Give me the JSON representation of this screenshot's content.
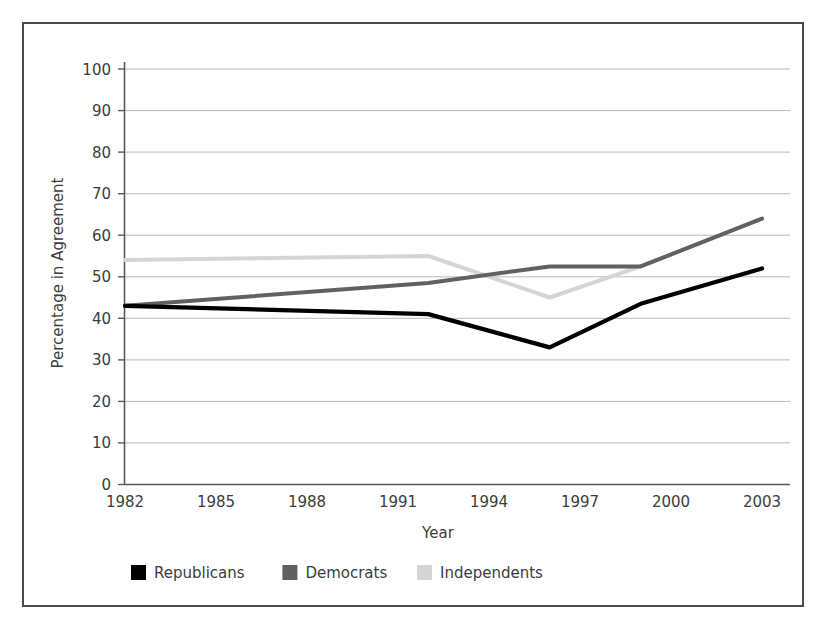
{
  "figure": {
    "background_color": "#ffffff",
    "frame_color": "#4a4a4a"
  },
  "chart_data": {
    "type": "line",
    "title": "",
    "xlabel": "Year",
    "ylabel": "Percentage in Agreement",
    "x": [
      1982,
      1992,
      1996,
      1999,
      2003
    ],
    "xticks": [
      1982,
      1985,
      1988,
      1991,
      1994,
      1997,
      2000,
      2003
    ],
    "xlim": [
      1982,
      2003
    ],
    "yticks": [
      0,
      10,
      20,
      30,
      40,
      50,
      60,
      70,
      80,
      90,
      100
    ],
    "ylim": [
      0,
      100
    ],
    "grid": "horizontal",
    "legend_position": "bottom",
    "series": [
      {
        "name": "Republicans",
        "color": "#000000",
        "values": [
          43,
          41,
          33,
          43.5,
          52
        ]
      },
      {
        "name": "Democrats",
        "color": "#616161",
        "values": [
          43,
          48.5,
          52.5,
          52.5,
          64
        ]
      },
      {
        "name": "Independents",
        "color": "#d5d5d5",
        "values": [
          54,
          55,
          45,
          52.5,
          64
        ]
      }
    ]
  },
  "axes": {
    "y_tick_labels": [
      "100",
      "90",
      "80",
      "70",
      "60",
      "50",
      "40",
      "30",
      "20",
      "10",
      "0"
    ],
    "x_tick_labels": [
      "1982",
      "1985",
      "1988",
      "1991",
      "1994",
      "1997",
      "2000",
      "2003"
    ],
    "y_axis_title": "Percentage in Agreement",
    "x_axis_title": "Year"
  },
  "legend": {
    "items": [
      {
        "label": "Republicans",
        "color": "#000000"
      },
      {
        "label": "Democrats",
        "color": "#616161"
      },
      {
        "label": "Independents",
        "color": "#d5d5d5"
      }
    ]
  }
}
